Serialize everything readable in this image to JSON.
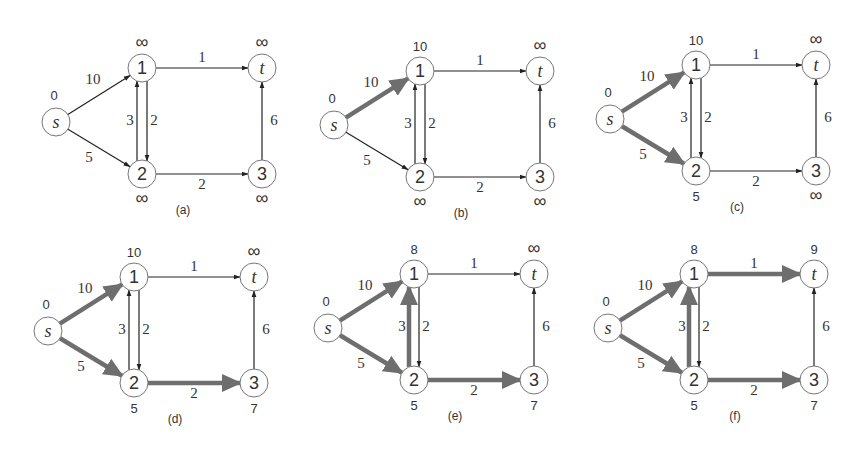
{
  "figure": {
    "colors": {
      "edge": "#222222",
      "highlight": "#6e6e6e",
      "node_stroke": "#777777",
      "text": "#333333"
    },
    "node_labels": [
      "s",
      "1",
      "2",
      "3",
      "t"
    ],
    "edges": [
      {
        "from": "s",
        "to": "1",
        "weight": "10"
      },
      {
        "from": "s",
        "to": "2",
        "weight": "5"
      },
      {
        "from": "1",
        "to": "t",
        "weight": "1"
      },
      {
        "from": "1",
        "to": "2",
        "weight": "2"
      },
      {
        "from": "2",
        "to": "1",
        "weight": "3"
      },
      {
        "from": "2",
        "to": "3",
        "weight": "2"
      },
      {
        "from": "3",
        "to": "t",
        "weight": "6"
      }
    ],
    "panels": [
      {
        "caption": "(a)",
        "origin": [
          56,
          122
        ],
        "dist": {
          "s": "0",
          "1": "∞",
          "2": "∞",
          "3": "∞",
          "t": "∞"
        },
        "highlighted": []
      },
      {
        "caption": "(b)",
        "origin": [
          334,
          125
        ],
        "dist": {
          "s": "0",
          "1": "10",
          "2": "∞",
          "3": "∞",
          "t": "∞"
        },
        "highlighted": [
          "s-1"
        ]
      },
      {
        "caption": "(c)",
        "origin": [
          610,
          119
        ],
        "dist": {
          "s": "0",
          "1": "10",
          "2": "5",
          "3": "∞",
          "t": "∞"
        },
        "highlighted": [
          "s-1",
          "s-2"
        ]
      },
      {
        "caption": "(d)",
        "origin": [
          48,
          331
        ],
        "dist": {
          "s": "0",
          "1": "10",
          "2": "5",
          "3": "7",
          "t": "∞"
        },
        "highlighted": [
          "s-1",
          "s-2",
          "2-3"
        ]
      },
      {
        "caption": "(e)",
        "origin": [
          328,
          328
        ],
        "dist": {
          "s": "0",
          "1": "8",
          "2": "5",
          "3": "7",
          "t": "∞"
        },
        "highlighted": [
          "s-1",
          "s-2",
          "2-3",
          "2-1"
        ]
      },
      {
        "caption": "(f)",
        "origin": [
          608,
          328
        ],
        "dist": {
          "s": "0",
          "1": "8",
          "2": "5",
          "3": "7",
          "t": "9"
        },
        "highlighted": [
          "s-1",
          "s-2",
          "2-3",
          "2-1",
          "1-t"
        ]
      }
    ]
  }
}
